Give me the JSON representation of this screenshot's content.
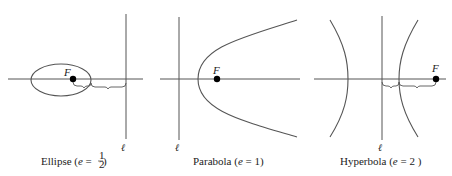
{
  "figure": {
    "panels": [
      {
        "name": "ellipse",
        "caption_prefix": "Ellipse (",
        "caption_var": "e",
        "caption_eq": " = ",
        "caption_num": "1",
        "caption_den": "2",
        "caption_suffix": " )",
        "focus_label": "F",
        "directrix_label": "ℓ",
        "eccentricity": "1/2"
      },
      {
        "name": "parabola",
        "caption_prefix": "Parabola (",
        "caption_var": "e",
        "caption_eq": " = 1)",
        "focus_label": "F",
        "directrix_label": "ℓ",
        "eccentricity": "1"
      },
      {
        "name": "hyperbola",
        "caption_prefix": "Hyperbola (",
        "caption_var": "e",
        "caption_eq": " = 2 )",
        "focus_label": "F",
        "directrix_label": "ℓ",
        "eccentricity": "2"
      }
    ],
    "colors": {
      "line": "#555555",
      "focus_dot": "#000000",
      "text": "#222222"
    }
  }
}
